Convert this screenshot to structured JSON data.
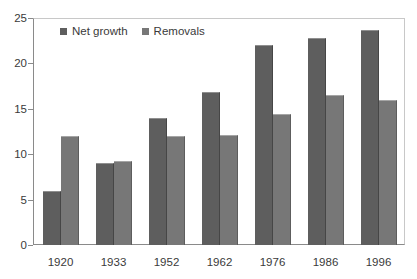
{
  "chart_data": {
    "type": "bar",
    "title": "",
    "subtitle": "",
    "xlabel": "",
    "ylabel": "",
    "categories": [
      "1920",
      "1933",
      "1952",
      "1962",
      "1976",
      "1986",
      "1996"
    ],
    "series": [
      {
        "name": "Net growth",
        "color": "#5e5e5e",
        "values": [
          6.0,
          9.0,
          14.0,
          16.8,
          22.0,
          22.8,
          23.7
        ]
      },
      {
        "name": "Removals",
        "color": "#777777",
        "values": [
          12.0,
          9.2,
          12.0,
          12.1,
          14.4,
          16.5,
          16.0
        ]
      }
    ],
    "ylim": [
      0,
      25
    ],
    "yticks": [
      0,
      5,
      10,
      15,
      20,
      25
    ],
    "ytick_labels": [
      "0",
      "5",
      "10",
      "15",
      "20",
      "25"
    ],
    "grid": false,
    "legend_position": "top-left-inside",
    "plot_background": "#ffffff",
    "axis_color": "#8a8a8a",
    "frame_color": "#c8c8c8"
  }
}
